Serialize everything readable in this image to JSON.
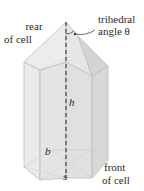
{
  "figure": {
    "labels": {
      "rear_line1": "rear",
      "rear_line2": "of cell",
      "trihedral_line1": "trihedral",
      "trihedral_line2": "angle θ",
      "height": "h",
      "base_width": "b",
      "side": "s",
      "front_line1": "front",
      "front_line2": "of cell"
    },
    "colors": {
      "face_light": "#eeeeee",
      "face_mid": "#e2e2e2",
      "face_dark": "#d6d6d6",
      "edge": "#b9b9b9",
      "axis": "#444444",
      "text": "#2a2a2a"
    }
  }
}
